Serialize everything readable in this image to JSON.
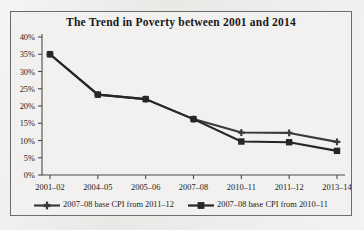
{
  "figure": {
    "title": "The Trend in Poverty between 2001 and 2014",
    "border_color": "#6d6c6a",
    "paper_color": "#f2f1ef",
    "ink_color": "#3a3a3a"
  },
  "chart_data": {
    "type": "line",
    "title": "The Trend in Poverty between 2001 and 2014",
    "xlabel": "",
    "ylabel": "",
    "categories": [
      "2001–02",
      "2004–05",
      "2005–06",
      "2007–08",
      "2010–11",
      "2011–12",
      "2013–14"
    ],
    "series": [
      {
        "name": "2007–08 base CPI from 2011–12",
        "marker": "cross",
        "color": "#3a3a3a",
        "values": [
          35,
          23.3,
          22,
          16.2,
          12.3,
          12.2,
          9.6
        ]
      },
      {
        "name": "2007–08 base CPI from 2010–11",
        "marker": "square",
        "color": "#262626",
        "values": [
          35,
          23.3,
          22,
          16.2,
          9.7,
          9.5,
          7
        ]
      }
    ],
    "ylim": [
      0,
      40
    ],
    "ytick_step": 5,
    "ytick_labels": [
      "0%",
      "5%",
      "10%",
      "15%",
      "20%",
      "25%",
      "30%",
      "35%",
      "40%"
    ],
    "grid": false,
    "legend_position": "bottom"
  },
  "legend": {
    "entries": [
      {
        "label": "2007–08 base CPI from 2011–12",
        "marker": "cross"
      },
      {
        "label": "2007–08 base CPI from 2010–11",
        "marker": "square"
      }
    ]
  }
}
